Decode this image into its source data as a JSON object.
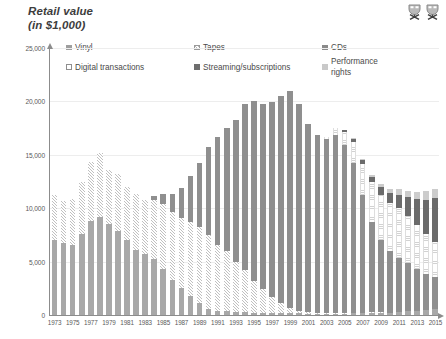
{
  "header": {
    "axis_title": "Retail value\n(in $1,000)",
    "icons": [
      {
        "name": "chart-icon-left",
        "label": "chart-glyph"
      },
      {
        "name": "chart-icon-right",
        "label": "chart-glyph"
      }
    ]
  },
  "chart_data": {
    "type": "bar",
    "stacked": true,
    "title": "Retail value (in $1,000)",
    "xlabel": "",
    "ylabel": "Retail value (in $1,000)",
    "ylim": [
      0,
      25000
    ],
    "yticks": [
      "0",
      "5,000",
      "10,000",
      "15,000",
      "20,000",
      "25,000"
    ],
    "ytick_values": [
      0,
      5000,
      10000,
      15000,
      20000,
      25000
    ],
    "grid": true,
    "legend_position": "top",
    "x": [
      1973,
      1974,
      1975,
      1976,
      1977,
      1978,
      1979,
      1980,
      1981,
      1982,
      1983,
      1984,
      1985,
      1986,
      1987,
      1988,
      1989,
      1990,
      1991,
      1992,
      1993,
      1994,
      1995,
      1996,
      1997,
      1998,
      1999,
      2000,
      2001,
      2002,
      2003,
      2004,
      2005,
      2006,
      2007,
      2008,
      2009,
      2010,
      2011,
      2012,
      2013,
      2014,
      2015
    ],
    "xtick_labels": [
      "1973",
      "1975",
      "1977",
      "1979",
      "1981",
      "1983",
      "1985",
      "1987",
      "1989",
      "1991",
      "1993",
      "1995",
      "1997",
      "1999",
      "2001",
      "2003",
      "2005",
      "2007",
      "2009",
      "2011",
      "2013",
      "2015"
    ],
    "series": [
      {
        "name": "Vinyl",
        "color": "#a8a8a8",
        "pattern": "solid",
        "values": [
          7000,
          6700,
          6600,
          7600,
          8800,
          9200,
          8500,
          7900,
          7000,
          6100,
          5700,
          5200,
          4300,
          3300,
          2500,
          1800,
          1100,
          600,
          400,
          350,
          300,
          250,
          220,
          200,
          190,
          180,
          170,
          150,
          140,
          130,
          120,
          130,
          140,
          150,
          160,
          180,
          200,
          230,
          280,
          350,
          420,
          480,
          520
        ]
      },
      {
        "name": "Tapes",
        "color": "#ffffff",
        "pattern": "diagonal-hatch",
        "values": [
          4200,
          4000,
          4300,
          4900,
          5500,
          6000,
          5100,
          5300,
          5000,
          5200,
          5100,
          5600,
          6100,
          6300,
          6600,
          6900,
          7100,
          6900,
          6200,
          5600,
          4700,
          4000,
          3000,
          2200,
          1500,
          900,
          500,
          250,
          120,
          60,
          30,
          15,
          8,
          5,
          3,
          2,
          1,
          0,
          0,
          0,
          0,
          0,
          0
        ]
      },
      {
        "name": "CDs",
        "color": "#8f8f8f",
        "pattern": "solid",
        "values": [
          0,
          0,
          0,
          0,
          0,
          0,
          0,
          0,
          0,
          0,
          0,
          300,
          900,
          1700,
          2800,
          4300,
          6000,
          8200,
          10100,
          11600,
          13300,
          15500,
          16800,
          17400,
          18300,
          19400,
          20300,
          19400,
          17600,
          16700,
          16300,
          16700,
          15700,
          14000,
          11000,
          8500,
          6800,
          5800,
          5100,
          4500,
          3900,
          3400,
          3000
        ]
      },
      {
        "name": "Digital transactions",
        "color": "#ffffff",
        "pattern": "fine-horizontal",
        "values": [
          0,
          0,
          0,
          0,
          0,
          0,
          0,
          0,
          0,
          0,
          0,
          0,
          0,
          0,
          0,
          0,
          0,
          0,
          0,
          0,
          0,
          0,
          0,
          0,
          0,
          0,
          0,
          0,
          0,
          0,
          200,
          600,
          1200,
          2000,
          2900,
          3700,
          4200,
          4500,
          4600,
          4400,
          4100,
          3700,
          3300
        ]
      },
      {
        "name": "Streaming/subscriptions",
        "color": "#6b6b6b",
        "pattern": "solid",
        "values": [
          0,
          0,
          0,
          0,
          0,
          0,
          0,
          0,
          0,
          0,
          0,
          0,
          0,
          0,
          0,
          0,
          0,
          0,
          0,
          0,
          0,
          0,
          0,
          0,
          0,
          0,
          0,
          0,
          0,
          0,
          0,
          0,
          200,
          300,
          400,
          500,
          700,
          900,
          1300,
          1800,
          2400,
          3200,
          4100
        ]
      },
      {
        "name": "Performance rights",
        "color": "#cccccc",
        "pattern": "solid",
        "values": [
          0,
          0,
          0,
          0,
          0,
          0,
          0,
          0,
          0,
          0,
          0,
          0,
          0,
          0,
          0,
          0,
          0,
          0,
          0,
          0,
          0,
          0,
          0,
          0,
          0,
          0,
          0,
          0,
          0,
          0,
          0,
          0,
          0,
          60,
          120,
          200,
          300,
          400,
          500,
          600,
          700,
          800,
          900
        ]
      }
    ],
    "totals": [
      11200,
      10700,
      10900,
      12500,
      14300,
      15200,
      13600,
      13200,
      12000,
      11300,
      10800,
      11100,
      11300,
      11300,
      11900,
      13000,
      14200,
      15700,
      16700,
      17550,
      18300,
      19750,
      20020,
      19800,
      19990,
      20480,
      20970,
      19800,
      17860,
      16890,
      16650,
      17445,
      17248,
      16515,
      14583,
      13082,
      12201,
      11830,
      11780,
      11650,
      11520,
      11580,
      11820
    ]
  },
  "xlabels": [
    "1973",
    "1975",
    "1977",
    "1979",
    "1981",
    "1983",
    "1985",
    "1987",
    "1989",
    "1991",
    "1993",
    "1995",
    "1997",
    "1999",
    "2001",
    "2003",
    "2005",
    "2007",
    "2009",
    "2011",
    "2013",
    "2015"
  ],
  "legend": {
    "items": [
      {
        "label": "Vinyl",
        "swatch": "vinyl"
      },
      {
        "label": "Tapes",
        "swatch": "tapes"
      },
      {
        "label": "CDs",
        "swatch": "cds"
      },
      {
        "label": "Digital transactions",
        "swatch": "digital"
      },
      {
        "label": "Streaming/subscriptions",
        "swatch": "streaming"
      },
      {
        "label": "Performance rights",
        "swatch": "perf"
      }
    ]
  }
}
